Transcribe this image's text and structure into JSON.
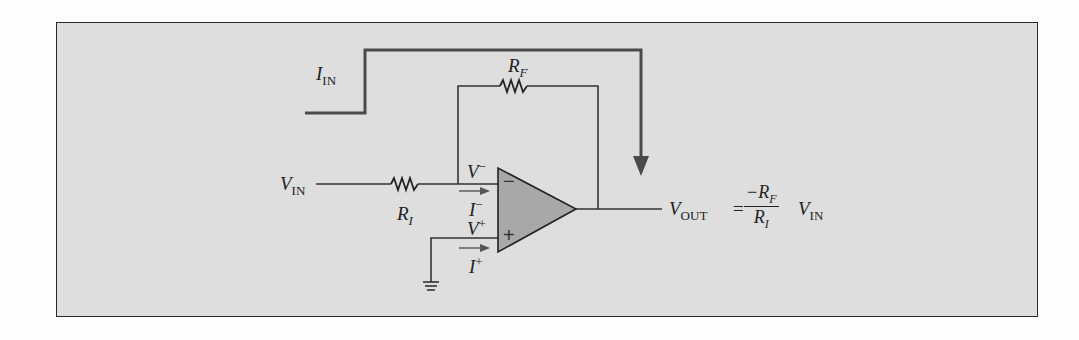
{
  "figure": {
    "labels": {
      "i_in": {
        "main": "I",
        "sub": "IN"
      },
      "r_f": {
        "main": "R",
        "sub": "F"
      },
      "v_in": {
        "main": "V",
        "sub": "IN"
      },
      "r_i": {
        "main": "R",
        "sub": "I"
      },
      "v_minus": {
        "main": "V",
        "sup": "−"
      },
      "i_minus": {
        "main": "I",
        "sup": "−"
      },
      "v_plus": {
        "main": "V",
        "sup": "+"
      },
      "i_plus": {
        "main": "I",
        "sup": "+"
      },
      "opamp_minus": "−",
      "opamp_plus": "+"
    },
    "equation": {
      "lhs_main": "V",
      "lhs_sub": "OUT",
      "equals": "=",
      "numerator_main": "−R",
      "numerator_sub": "F",
      "denominator_main": "R",
      "denominator_sub": "I",
      "rhs_main": "V",
      "rhs_sub": "IN"
    },
    "colors": {
      "panel_bg": "#dedede",
      "border": "#2a2a2a",
      "wire": "#3a3a3a",
      "current_path": "#4a4a4a",
      "opamp_fill": "#a8a8a8"
    }
  }
}
